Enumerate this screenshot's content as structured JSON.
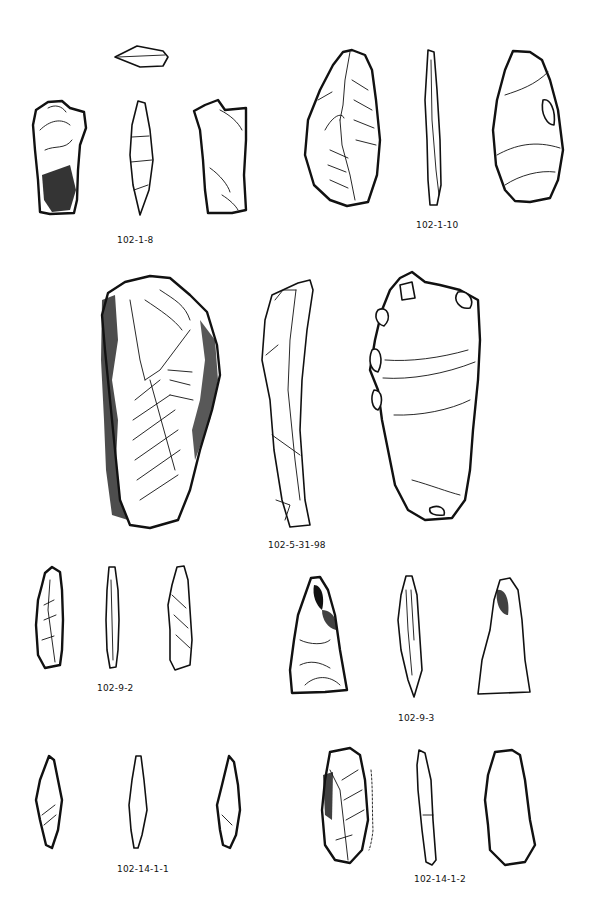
{
  "figure": {
    "background": "#ffffff",
    "ink": "#111111"
  },
  "artifacts": [
    {
      "id": "102-1-8",
      "label": "102-1-8",
      "views": [
        "platform",
        "dorsal",
        "lateral",
        "ventral"
      ]
    },
    {
      "id": "102-1-10",
      "label": "102-1-10",
      "views": [
        "dorsal",
        "lateral",
        "ventral"
      ]
    },
    {
      "id": "102-5-31-98",
      "label": "102-5-31-98",
      "views": [
        "dorsal",
        "lateral",
        "ventral"
      ]
    },
    {
      "id": "102-9-2",
      "label": "102-9-2",
      "views": [
        "dorsal",
        "lateral",
        "ventral"
      ]
    },
    {
      "id": "102-9-3",
      "label": "102-9-3",
      "views": [
        "dorsal",
        "lateral",
        "ventral"
      ]
    },
    {
      "id": "102-14-1-1",
      "label": "102-14-1-1",
      "views": [
        "dorsal",
        "lateral",
        "ventral"
      ]
    },
    {
      "id": "102-14-1-2",
      "label": "102-14-1-2",
      "views": [
        "dorsal",
        "lateral",
        "ventral"
      ]
    }
  ]
}
